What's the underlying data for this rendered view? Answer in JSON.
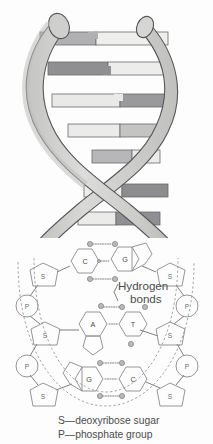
{
  "figure": {
    "background_color": "#fdfdfd"
  },
  "helix": {
    "name": "dna-double-helix",
    "strand_fill": "#d2d2d0",
    "strand_shadow": "#b9b9b7",
    "strand_outline": "#58585a",
    "rung_light": "#e8e8e6",
    "rung_mid": "#c9c9c7",
    "rung_dark": "#8f8f91",
    "rungs": [
      {
        "id": "rung-1",
        "y": 38,
        "left_tone": "mid",
        "right_tone": "light"
      },
      {
        "id": "rung-2",
        "y": 68,
        "left_tone": "dark",
        "right_tone": "light"
      },
      {
        "id": "rung-3",
        "y": 98,
        "left_tone": "light",
        "right_tone": "dark"
      },
      {
        "id": "rung-4",
        "y": 128,
        "left_tone": "light",
        "right_tone": "mid"
      },
      {
        "id": "rung-5",
        "y": 158,
        "left_tone": "mid",
        "right_tone": "light"
      },
      {
        "id": "rung-6",
        "y": 190,
        "left_tone": "light",
        "right_tone": "dark"
      },
      {
        "id": "rung-7",
        "y": 216,
        "left_tone": "light",
        "right_tone": "dark"
      }
    ]
  },
  "detail": {
    "name": "base-pair-detail",
    "colors": {
      "pyrimidine_fill": "#dededc",
      "purine_fill": "#9a9a9c",
      "thymine_fill": "#a8a8aa",
      "sugar_fill": "#d8d8d6",
      "phosphate_fill": "#e2e2e0",
      "outline": "#8a8a8c"
    },
    "base_pairs": [
      {
        "id": "pair-1",
        "left_base": "C",
        "right_base": "G",
        "left_type": "pyrimidine",
        "right_type": "purine",
        "hydrogen_bond_count": 3
      },
      {
        "id": "pair-2",
        "left_base": "A",
        "right_base": "T",
        "left_type": "purine",
        "right_type": "pyrimidine",
        "hydrogen_bond_count": 2
      },
      {
        "id": "pair-3",
        "left_base": "G",
        "right_base": "C",
        "left_type": "purine",
        "right_type": "pyrimidine",
        "hydrogen_bond_count": 3
      }
    ],
    "backbone_left": [
      {
        "id": "left-s-1",
        "symbol": "S",
        "shape": "pentagon"
      },
      {
        "id": "left-p-1",
        "symbol": "P",
        "shape": "circle"
      },
      {
        "id": "left-s-2",
        "symbol": "S",
        "shape": "pentagon"
      },
      {
        "id": "left-p-2",
        "symbol": "P",
        "shape": "circle"
      },
      {
        "id": "left-s-3",
        "symbol": "S",
        "shape": "pentagon"
      }
    ],
    "backbone_right": [
      {
        "id": "right-s-1",
        "symbol": "S",
        "shape": "pentagon"
      },
      {
        "id": "right-p-1",
        "symbol": "P",
        "shape": "circle"
      },
      {
        "id": "right-s-2",
        "symbol": "S",
        "shape": "pentagon"
      },
      {
        "id": "right-p-2",
        "symbol": "P",
        "shape": "circle"
      },
      {
        "id": "right-s-3",
        "symbol": "S",
        "shape": "pentagon"
      }
    ]
  },
  "annotations": {
    "hydrogen_bonds_line1": "Hydrogen",
    "hydrogen_bonds_line2": "bonds"
  },
  "caption": {
    "line1": "S—deoxyribose sugar",
    "line2": "P—phosphate group"
  }
}
